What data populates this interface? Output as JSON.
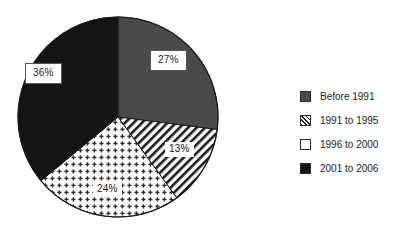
{
  "chart_data": {
    "type": "pie",
    "title": "",
    "subtitle": "",
    "xlabel": "",
    "ylabel": "",
    "grid": false,
    "legend_position": "right",
    "start_angle_deg": 0,
    "direction": "clockwise",
    "center": {
      "x": 118,
      "y": 117
    },
    "radius": 100,
    "categories": [
      "Before 1991",
      "1991 to 1995",
      "1996 to 2000",
      "2001 to 2006"
    ],
    "values": [
      27,
      13,
      24,
      36
    ],
    "value_unit": "%",
    "data_labels": [
      "27%",
      "13%",
      "24%",
      "36%"
    ],
    "slices": [
      {
        "label": "Before 1991",
        "value": 27,
        "data_label": "27%",
        "fill_style": "solid",
        "color": "#4a4a4a",
        "start_deg": 0,
        "end_deg": 97.2
      },
      {
        "label": "1991 to 1995",
        "value": 13,
        "data_label": "13%",
        "fill_style": "diagonal-hatch",
        "color": "#ffffff",
        "pattern_color": "#1a1a1a",
        "start_deg": 97.2,
        "end_deg": 144.0
      },
      {
        "label": "1996 to 2000",
        "value": 24,
        "data_label": "24%",
        "fill_style": "dotted",
        "color": "#ffffff",
        "pattern_color": "#2a2a2a",
        "start_deg": 144.0,
        "end_deg": 230.4
      },
      {
        "label": "2001 to 2006",
        "value": 36,
        "data_label": "36%",
        "fill_style": "solid",
        "color": "#141414",
        "start_deg": 230.4,
        "end_deg": 360.0
      }
    ]
  },
  "labels": {
    "before_1991": "27%",
    "y1991_1995": "13%",
    "y1996_2000": "24%",
    "y2001_2006": "36%"
  },
  "legend": {
    "items": [
      {
        "label": "Before 1991",
        "swatch": "solid-gray-swatch"
      },
      {
        "label": "1991 to 1995",
        "swatch": "hatched-swatch"
      },
      {
        "label": "1996 to 2000",
        "swatch": "white-swatch"
      },
      {
        "label": "2001 to 2006",
        "swatch": "solid-black-swatch"
      }
    ]
  },
  "colors": {
    "slice_gray": "#4a4a4a",
    "slice_black": "#141414",
    "slice_white": "#ffffff",
    "pattern_ink": "#1a1a1a",
    "outline": "#1a1a1a",
    "text": "#1b1b1b",
    "background": "#ffffff"
  }
}
